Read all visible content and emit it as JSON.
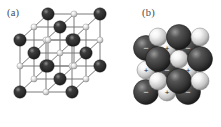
{
  "figure": {
    "background_color": "#ffffff",
    "width": 221,
    "height": 127,
    "panels": [
      {
        "id": "a",
        "label": "(a)",
        "kind": "ball-and-stick-lattice",
        "description": "Rock-salt (NaCl-type) cubic unit cell drawn as a ball-and-stick model in isometric projection",
        "lattice": {
          "grid": 3,
          "projection": "isometric",
          "bond_color": "#7a7a7a",
          "bond_width": 1,
          "species": [
            {
              "name": "anion",
              "role": "large",
              "radius": 6.2,
              "color_core": "#3c3c3c",
              "color_mid": "#2a2a2a",
              "color_edge": "#161616",
              "highlight": "#8e8e8e"
            },
            {
              "name": "cation",
              "role": "small",
              "radius": 3.1,
              "color_core": "#f2f2f2",
              "color_mid": "#c8c8c8",
              "color_edge": "#8a8a8a",
              "highlight": "#ffffff"
            }
          ],
          "origin": {
            "x": 20,
            "y": 40
          },
          "axis_a": {
            "x": 26,
            "y": 0
          },
          "axis_b": {
            "x": 0,
            "y": 26
          },
          "axis_c": {
            "x": 14,
            "y": -13
          }
        }
      },
      {
        "id": "b",
        "label": "(b)",
        "kind": "space-filling-packing",
        "description": "Close-packed ionic solid shown as touching spheres with alternating positive and negative charge labels",
        "packing": {
          "projection": "isometric",
          "sign_positive": "+",
          "sign_negative": "−",
          "sign_color_on_dark": "#e8e8e8",
          "sign_color_on_light": "#1d1d1d",
          "species": [
            {
              "name": "anion",
              "sign": "−",
              "radius": 12.5,
              "color_core": "#555555",
              "color_mid": "#333333",
              "color_edge": "#121212",
              "highlight": "#9a9a9a"
            },
            {
              "name": "cation",
              "sign": "+",
              "radius": 9.0,
              "color_core": "#f4f4f4",
              "color_mid": "#c4c4c4",
              "color_edge": "#7e7e7e",
              "highlight": "#ffffff"
            }
          ],
          "origin": {
            "x": 36,
            "y": 48
          },
          "axis_a": {
            "x": 21,
            "y": 0
          },
          "axis_b": {
            "x": 0,
            "y": 22
          },
          "axis_c": {
            "x": 12,
            "y": -11
          },
          "rows": 3,
          "cols": 3,
          "layers": 2,
          "labeled_front_signs": [
            [
              "−",
              "+",
              "−"
            ],
            [
              "+",
              "−",
              "+"
            ],
            [
              "−",
              "+",
              "−"
            ]
          ]
        }
      }
    ]
  }
}
